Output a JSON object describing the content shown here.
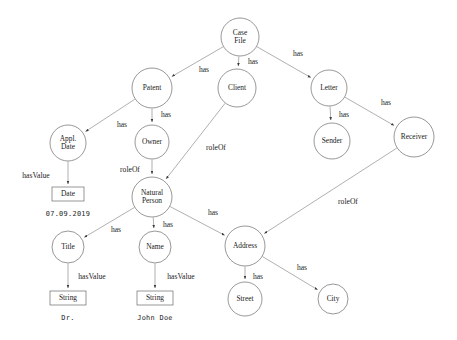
{
  "diagram": {
    "type": "knowledge-graph",
    "nodes": [
      {
        "id": "case_file",
        "label_lines": [
          "Case",
          "File"
        ],
        "shape": "circle",
        "cx": 240,
        "cy": 37,
        "r": 19
      },
      {
        "id": "patent",
        "label_lines": [
          "Patent"
        ],
        "shape": "circle",
        "cx": 152,
        "cy": 88,
        "r": 20
      },
      {
        "id": "client",
        "label_lines": [
          "Client"
        ],
        "shape": "circle",
        "cx": 237,
        "cy": 88,
        "r": 19
      },
      {
        "id": "letter",
        "label_lines": [
          "Letter"
        ],
        "shape": "circle",
        "cx": 329,
        "cy": 88,
        "r": 18
      },
      {
        "id": "appl_date",
        "label_lines": [
          "Appl.",
          "Date"
        ],
        "shape": "circle",
        "cx": 68,
        "cy": 143,
        "r": 18
      },
      {
        "id": "owner",
        "label_lines": [
          "Owner"
        ],
        "shape": "circle",
        "cx": 152,
        "cy": 142,
        "r": 17
      },
      {
        "id": "sender",
        "label_lines": [
          "Sender"
        ],
        "shape": "circle",
        "cx": 332,
        "cy": 141,
        "r": 18
      },
      {
        "id": "receiver",
        "label_lines": [
          "Receiver"
        ],
        "shape": "circle",
        "cx": 414,
        "cy": 137,
        "r": 20
      },
      {
        "id": "natural_person",
        "label_lines": [
          "Natural",
          "Person"
        ],
        "shape": "circle",
        "cx": 152,
        "cy": 197,
        "r": 20
      },
      {
        "id": "title",
        "label_lines": [
          "Title"
        ],
        "shape": "circle",
        "cx": 68,
        "cy": 247,
        "r": 16
      },
      {
        "id": "name",
        "label_lines": [
          "Name"
        ],
        "shape": "circle",
        "cx": 155,
        "cy": 247,
        "r": 16
      },
      {
        "id": "address",
        "label_lines": [
          "Address"
        ],
        "shape": "circle",
        "cx": 245,
        "cy": 246,
        "r": 20
      },
      {
        "id": "street",
        "label_lines": [
          "Street"
        ],
        "shape": "circle",
        "cx": 245,
        "cy": 299,
        "r": 17
      },
      {
        "id": "city",
        "label_lines": [
          "City"
        ],
        "shape": "circle",
        "cx": 333,
        "cy": 299,
        "r": 15
      },
      {
        "id": "date_literal",
        "label_lines": [
          "Date"
        ],
        "shape": "rect",
        "cx": 68,
        "cy": 194,
        "w": 32,
        "h": 14
      },
      {
        "id": "string_title",
        "label_lines": [
          "String"
        ],
        "shape": "rect",
        "cx": 68,
        "cy": 298,
        "w": 36,
        "h": 14
      },
      {
        "id": "string_name",
        "label_lines": [
          "String"
        ],
        "shape": "rect",
        "cx": 155,
        "cy": 298,
        "w": 36,
        "h": 14
      }
    ],
    "edges": [
      {
        "id": "e_casefile_patent",
        "from": "case_file",
        "to": "patent",
        "label": "has",
        "lx": 204,
        "ly": 70
      },
      {
        "id": "e_casefile_client",
        "from": "case_file",
        "to": "client",
        "label": "has",
        "lx": 253,
        "ly": 62
      },
      {
        "id": "e_casefile_letter",
        "from": "case_file",
        "to": "letter",
        "label": "has",
        "lx": 298,
        "ly": 54
      },
      {
        "id": "e_patent_appldate",
        "from": "patent",
        "to": "appl_date",
        "label": "has",
        "lx": 122,
        "ly": 125
      },
      {
        "id": "e_patent_owner",
        "from": "patent",
        "to": "owner",
        "label": "has",
        "lx": 166,
        "ly": 115
      },
      {
        "id": "e_letter_sender",
        "from": "letter",
        "to": "sender",
        "label": "has",
        "lx": 344,
        "ly": 115
      },
      {
        "id": "e_letter_receiver",
        "from": "letter",
        "to": "receiver",
        "label": "has",
        "lx": 386,
        "ly": 103
      },
      {
        "id": "e_appldate_date",
        "from": "appl_date",
        "to": "date_literal",
        "label": "hasValue",
        "lx": 36,
        "ly": 176
      },
      {
        "id": "e_owner_person",
        "from": "owner",
        "to": "natural_person",
        "label": "roleOf",
        "lx": 130,
        "ly": 170
      },
      {
        "id": "e_client_person",
        "from": "client",
        "to": "natural_person",
        "label": "roleOf",
        "lx": 216,
        "ly": 148
      },
      {
        "id": "e_person_title",
        "from": "natural_person",
        "to": "title",
        "label": "has",
        "lx": 116,
        "ly": 230
      },
      {
        "id": "e_person_name",
        "from": "natural_person",
        "to": "name",
        "label": "has",
        "lx": 168,
        "ly": 225
      },
      {
        "id": "e_person_address",
        "from": "natural_person",
        "to": "address",
        "label": "has",
        "lx": 213,
        "ly": 213
      },
      {
        "id": "e_receiver_address",
        "from": "receiver",
        "to": "address",
        "label": "roleOf",
        "lx": 348,
        "ly": 202
      },
      {
        "id": "e_title_string",
        "from": "title",
        "to": "string_title",
        "label": "hasValue",
        "lx": 92,
        "ly": 277
      },
      {
        "id": "e_name_string",
        "from": "name",
        "to": "string_name",
        "label": "hasValue",
        "lx": 181,
        "ly": 277
      },
      {
        "id": "e_address_street",
        "from": "address",
        "to": "street",
        "label": "has",
        "lx": 258,
        "ly": 277
      },
      {
        "id": "e_address_city",
        "from": "address",
        "to": "city",
        "label": "has",
        "lx": 302,
        "ly": 268
      }
    ],
    "literals": [
      {
        "id": "lit_date",
        "text": "07.09.2019",
        "x": 68,
        "y": 214
      },
      {
        "id": "lit_title_value",
        "text": "Dr.",
        "x": 68,
        "y": 318
      },
      {
        "id": "lit_name_value",
        "text": "John Doe",
        "x": 155,
        "y": 318
      }
    ],
    "colors": {
      "node_stroke": "#6b6b6b",
      "edge_stroke": "#7a7a7a",
      "text": "#222222",
      "background": "#ffffff"
    }
  }
}
